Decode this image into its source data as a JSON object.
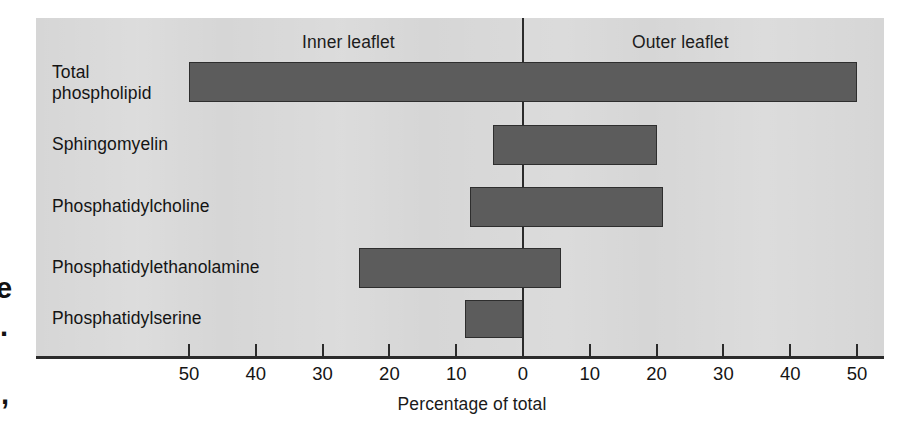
{
  "chart_data": {
    "type": "bar",
    "orientation": "horizontal",
    "layout": "diverging-bidirectional",
    "title": "",
    "xlabel": "Percentage of total",
    "ylabel": "",
    "xlim": [
      -55,
      55
    ],
    "grid": false,
    "legend_position": "top-inline",
    "panel_headings": {
      "left": "Inner leaflet",
      "right": "Outer leaflet"
    },
    "categories": [
      "Total\nphospholipid",
      "Sphingomyelin",
      "Phosphatidylcholine",
      "Phosphatidylethanolamine",
      "Phosphatidylserine"
    ],
    "series": [
      {
        "name": "Inner leaflet",
        "values": [
          50,
          4.5,
          8,
          24.5,
          8.7
        ]
      },
      {
        "name": "Outer leaflet",
        "values": [
          50,
          20,
          21,
          5.7,
          0
        ]
      }
    ],
    "tick_values_left": [
      50,
      40,
      30,
      20,
      10
    ],
    "tick_values_right": [
      10,
      20,
      30,
      40,
      50
    ],
    "tick_center": 0,
    "tick_labels": [
      "50",
      "40",
      "30",
      "20",
      "10",
      "0",
      "10",
      "20",
      "30",
      "40",
      "50"
    ],
    "bar_color": "#5c5c5c",
    "bar_border_color": "#2e2e2e",
    "panel_background": "#d6d6d6",
    "axis_color": "#2b2b2b"
  },
  "page_bleed": {
    "fragment_e": "e",
    "fragment_dot": ".",
    "fragment_comma": ","
  }
}
